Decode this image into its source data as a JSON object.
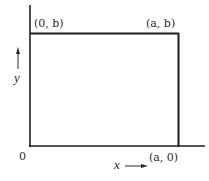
{
  "diagram": {
    "type": "rectangle-region",
    "colors": {
      "line": "#1e1e1e",
      "text": "#2a2a2a",
      "background": "#ffffff"
    },
    "labels": {
      "top_left": "(0, b)",
      "top_right": "(a, b)",
      "origin": "0",
      "bottom_right": "(a, 0)",
      "y_axis": "y",
      "x_axis": "x"
    },
    "arrows": {
      "y_axis_arrow": "up",
      "x_axis_arrow": "right"
    },
    "vertices": [
      {
        "name": "origin",
        "coord": "0"
      },
      {
        "name": "bottom-right",
        "coord": "(a, 0)"
      },
      {
        "name": "top-right",
        "coord": "(a, b)"
      },
      {
        "name": "top-left",
        "coord": "(0, b)"
      }
    ]
  }
}
